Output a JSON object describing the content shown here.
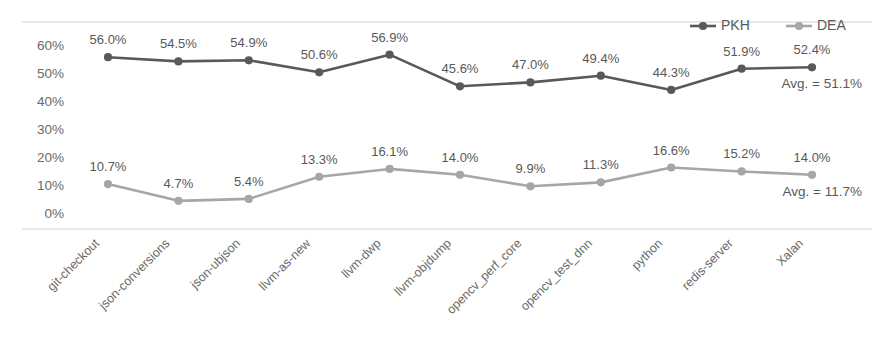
{
  "chart_data": {
    "type": "line",
    "title": "",
    "xlabel": "",
    "ylabel": "",
    "ylim": [
      0,
      60
    ],
    "ytick_labels": [
      "60%",
      "50%",
      "40%",
      "30%",
      "20%",
      "10%",
      "0%"
    ],
    "ytick_values": [
      60,
      50,
      40,
      30,
      20,
      10,
      0
    ],
    "grid": false,
    "legend_position": "top-right",
    "categories": [
      "git-checkout",
      "json-conversions",
      "json-ubjson",
      "llvm-as-new",
      "llvm-dwp",
      "llvm-objdump",
      "opencv_perf_core",
      "opencv_test_dnn",
      "python",
      "redis-server",
      "Xalan"
    ],
    "series": [
      {
        "name": "PKH",
        "color": "#595959",
        "values": [
          56.0,
          54.5,
          54.9,
          50.6,
          56.9,
          45.6,
          47.0,
          49.4,
          44.3,
          51.9,
          52.4
        ],
        "labels": [
          "56.0%",
          "54.5%",
          "54.9%",
          "50.6%",
          "56.9%",
          "45.6%",
          "47.0%",
          "49.4%",
          "44.3%",
          "51.9%",
          "52.4%"
        ],
        "average_annotation": "Avg. = 51.1%",
        "average": 51.1
      },
      {
        "name": "DEA",
        "color": "#a6a6a6",
        "values": [
          10.7,
          4.7,
          5.4,
          13.3,
          16.1,
          14.0,
          9.9,
          11.3,
          16.6,
          15.2,
          14.0
        ],
        "labels": [
          "10.7%",
          "4.7%",
          "5.4%",
          "13.3%",
          "16.1%",
          "14.0%",
          "9.9%",
          "11.3%",
          "16.6%",
          "15.2%",
          "14.0%"
        ],
        "average_annotation": "Avg. = 11.7%",
        "average": 11.7
      }
    ]
  },
  "legend": {
    "items": [
      {
        "label": "PKH",
        "color": "#595959"
      },
      {
        "label": "DEA",
        "color": "#a6a6a6"
      }
    ]
  }
}
